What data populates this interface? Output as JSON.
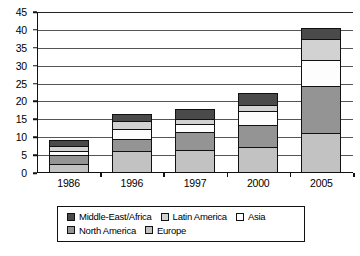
{
  "chart_data": {
    "type": "bar",
    "subtype": "stacked-bar",
    "title": "",
    "xlabel": "",
    "ylabel": "",
    "categories": [
      "1986",
      "1996",
      "1997",
      "2000",
      "2005"
    ],
    "ylim": [
      0,
      45
    ],
    "yticks": [
      0,
      5,
      10,
      15,
      20,
      25,
      30,
      35,
      40,
      45
    ],
    "ytick_labels": [
      "0",
      "5",
      "10",
      "15",
      "20",
      "25",
      "30",
      "35",
      "40",
      "45"
    ],
    "grid": true,
    "grid_axis": "y",
    "legend_position": "bottom",
    "stack_order_bottom_to_top": [
      "Europe",
      "North America",
      "Asia",
      "Latin America",
      "Middle-East/Africa"
    ],
    "series": [
      {
        "name": "Europe",
        "color": "#c2c2c2",
        "values": [
          2.0,
          5.6,
          5.8,
          6.8,
          10.7
        ]
      },
      {
        "name": "North America",
        "color": "#949494",
        "values": [
          2.6,
          3.4,
          5.2,
          6.1,
          13.0
        ]
      },
      {
        "name": "Asia",
        "color": "#fdfdfd",
        "values": [
          0.9,
          2.7,
          2.2,
          4.0,
          7.3
        ]
      },
      {
        "name": "Latin America",
        "color": "#d2d2d2",
        "values": [
          1.5,
          2.3,
          1.4,
          1.5,
          6.0
        ]
      },
      {
        "name": "Middle-East/Africa",
        "color": "#4a4a4a",
        "values": [
          1.6,
          2.0,
          2.8,
          3.3,
          3.0
        ]
      }
    ],
    "totals": [
      8.6,
      16.0,
      17.4,
      21.7,
      40.0
    ],
    "legend_entries": [
      {
        "label": "Middle-East/Africa",
        "color": "#4a4a4a"
      },
      {
        "label": "Latin America",
        "color": "#d2d2d2"
      },
      {
        "label": "Asia",
        "color": "#fdfdfd"
      },
      {
        "label": "North America",
        "color": "#949494"
      },
      {
        "label": "Europe",
        "color": "#c2c2c2"
      }
    ]
  }
}
